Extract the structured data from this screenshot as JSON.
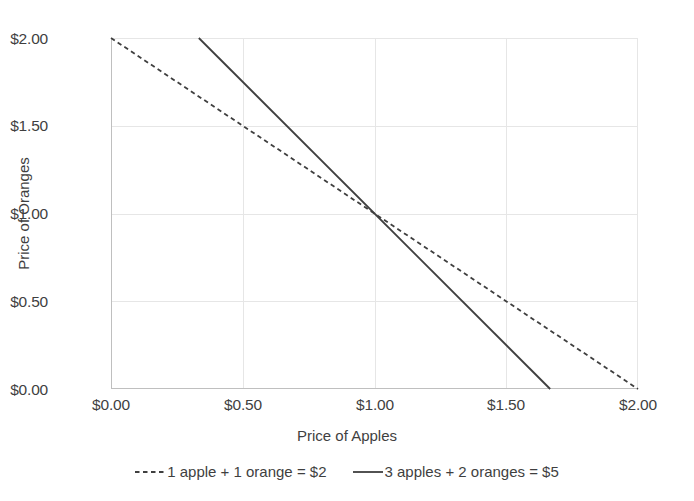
{
  "chart_data": {
    "type": "line",
    "title": "",
    "xlabel": "Price of Apples",
    "ylabel": "Price of Oranges",
    "xlim": [
      0,
      2
    ],
    "ylim": [
      0,
      2
    ],
    "xticks": [
      "$0.00",
      "$0.50",
      "$1.00",
      "$1.50",
      "$2.00"
    ],
    "xtick_values": [
      0,
      0.5,
      1.0,
      1.5,
      2.0
    ],
    "yticks": [
      "$0.00",
      "$0.50",
      "$1.00",
      "$1.50",
      "$2.00"
    ],
    "ytick_values": [
      0,
      0.5,
      1.0,
      1.5,
      2.0
    ],
    "grid": true,
    "legend_position": "bottom",
    "intersection": {
      "x": 1.0,
      "y": 1.0
    },
    "series": [
      {
        "name": "1 apple + 1 orange = $2",
        "style": "dotted",
        "color": "#3f3f3f",
        "x": [
          0,
          2.0
        ],
        "values": [
          2.0,
          0
        ]
      },
      {
        "name": "3 apples + 2 oranges = $5",
        "style": "solid",
        "color": "#3f3f3f",
        "x": [
          0.3333,
          1.6667
        ],
        "values": [
          2.0,
          0
        ]
      }
    ],
    "colors": {
      "line": "#3f3f3f",
      "grid": "#e6e6e6",
      "axis": "#bfbfbf",
      "text": "#3f3f3f",
      "background": "#ffffff"
    }
  }
}
